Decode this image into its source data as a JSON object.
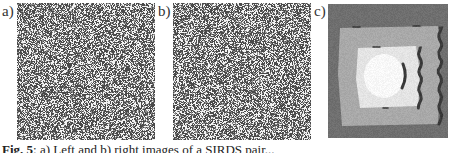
{
  "figure": {
    "panels": [
      {
        "label": "a)",
        "type": "random-dot-image",
        "description": "left image of random dot stereogram"
      },
      {
        "label": "b)",
        "type": "random-dot-image",
        "description": "right image of random dot stereogram"
      },
      {
        "label": "c)",
        "type": "disparity-map",
        "description": "disparity map with nested square regions and dark occlusion crescents"
      }
    ],
    "caption": {
      "prefix": "Fig. 5",
      "text": ": a) Left and b) right images of a SIRDS pair..."
    }
  },
  "colors": {
    "noise_dark": "#4a4a4a",
    "noise_mid": "#8c8c8c",
    "noise_light": "#f2f2f2",
    "disp_background": "#6f6f6f",
    "disp_mid": "#a9a9a9",
    "disp_light": "#e4e4e4",
    "disp_center": "#f8f8f8",
    "disp_occlusion": "#3a3a3a"
  }
}
